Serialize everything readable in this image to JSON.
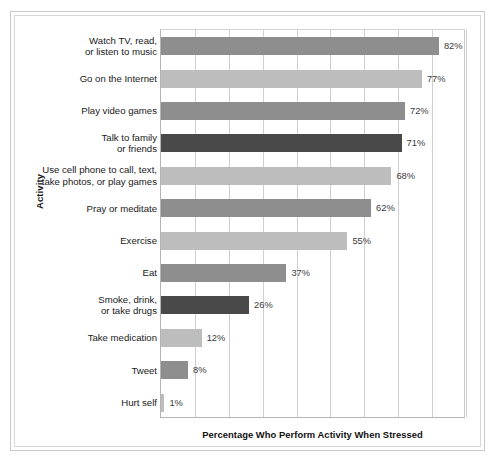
{
  "chart_data": {
    "type": "bar",
    "orientation": "horizontal",
    "title": "",
    "xlabel": "Percentage Who Perform Activity When Stressed",
    "ylabel": "Activity",
    "xlim": [
      0,
      90
    ],
    "grid": true,
    "gridlines_x": [
      10,
      20,
      30,
      40,
      50,
      60,
      70,
      80,
      90
    ],
    "tick_labels_shown": false,
    "legend": null,
    "value_suffix": "%",
    "categories": [
      "Watch TV, read, or listen to music",
      "Go on the Internet",
      "Play video games",
      "Talk to family or friends",
      "Use cell phone to call, text, take photos, or play games",
      "Pray or meditate",
      "Exercise",
      "Eat",
      "Smoke, drink, or take drugs",
      "Take medication",
      "Tweet",
      "Hurt self"
    ],
    "values": [
      82,
      77,
      72,
      71,
      68,
      62,
      55,
      37,
      26,
      12,
      8,
      1
    ],
    "bars": [
      {
        "label_line1": "Watch TV, read,",
        "label_line2": "or listen to music",
        "value": 82,
        "value_label": "82%",
        "color": "#8e8e8e"
      },
      {
        "label_line1": "Go on the Internet",
        "label_line2": "",
        "value": 77,
        "value_label": "77%",
        "color": "#bdbdbd"
      },
      {
        "label_line1": "Play video games",
        "label_line2": "",
        "value": 72,
        "value_label": "72%",
        "color": "#8e8e8e"
      },
      {
        "label_line1": "Talk to family",
        "label_line2": "or friends",
        "value": 71,
        "value_label": "71%",
        "color": "#494949"
      },
      {
        "label_line1": "Use cell phone to call, text,",
        "label_line2": "take photos, or play games",
        "value": 68,
        "value_label": "68%",
        "color": "#bdbdbd"
      },
      {
        "label_line1": "Pray or meditate",
        "label_line2": "",
        "value": 62,
        "value_label": "62%",
        "color": "#8e8e8e"
      },
      {
        "label_line1": "Exercise",
        "label_line2": "",
        "value": 55,
        "value_label": "55%",
        "color": "#bdbdbd"
      },
      {
        "label_line1": "Eat",
        "label_line2": "",
        "value": 37,
        "value_label": "37%",
        "color": "#8e8e8e"
      },
      {
        "label_line1": "Smoke, drink,",
        "label_line2": "or take drugs",
        "value": 26,
        "value_label": "26%",
        "color": "#494949"
      },
      {
        "label_line1": "Take medication",
        "label_line2": "",
        "value": 12,
        "value_label": "12%",
        "color": "#bdbdbd"
      },
      {
        "label_line1": "Tweet",
        "label_line2": "",
        "value": 8,
        "value_label": "8%",
        "color": "#8e8e8e"
      },
      {
        "label_line1": "Hurt self",
        "label_line2": "",
        "value": 1,
        "value_label": "1%",
        "color": "#bdbdbd"
      }
    ]
  },
  "colors": {
    "bar_medium_gray": "#8e8e8e",
    "bar_light_gray": "#bdbdbd",
    "bar_dark_gray": "#494949",
    "gridline": "#cfcfcf",
    "axis": "#b4b4b4",
    "text": "#1a1a1a",
    "background": "#ffffff"
  }
}
